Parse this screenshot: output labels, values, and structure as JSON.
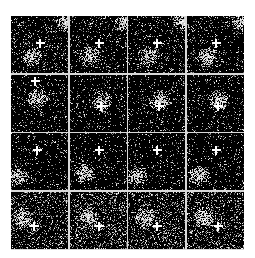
{
  "figure": {
    "layout": {
      "rows": 4,
      "cols": 4
    },
    "background": "#ffffff",
    "separator_color": "#d8d8d8",
    "panel_color": "#000000",
    "panels": [
      {
        "row": 0,
        "col": 0,
        "blob": [
          0.35,
          0.7
        ],
        "corner": [
          0.95,
          0.1
        ],
        "cross": [
          0.5,
          0.48
        ],
        "density": 0.12
      },
      {
        "row": 0,
        "col": 1,
        "blob": [
          0.35,
          0.7
        ],
        "corner": [
          0.95,
          0.1
        ],
        "cross": [
          0.5,
          0.48
        ],
        "density": 0.12
      },
      {
        "row": 0,
        "col": 2,
        "blob": [
          0.35,
          0.7
        ],
        "corner": [
          0.95,
          0.1
        ],
        "cross": [
          0.5,
          0.48
        ],
        "density": 0.12
      },
      {
        "row": 0,
        "col": 3,
        "blob": [
          0.35,
          0.72
        ],
        "corner": [
          0.95,
          0.1
        ],
        "cross": [
          0.5,
          0.48
        ],
        "density": 0.12
      },
      {
        "row": 1,
        "col": 0,
        "blob": [
          0.45,
          0.4
        ],
        "corner": null,
        "cross": [
          0.42,
          0.1
        ],
        "density": 0.1
      },
      {
        "row": 1,
        "col": 1,
        "blob": [
          0.55,
          0.45
        ],
        "corner": null,
        "cross": [
          0.55,
          0.55
        ],
        "density": 0.1
      },
      {
        "row": 1,
        "col": 2,
        "blob": [
          0.55,
          0.45
        ],
        "corner": null,
        "cross": [
          0.55,
          0.55
        ],
        "density": 0.1
      },
      {
        "row": 1,
        "col": 3,
        "blob": [
          0.55,
          0.45
        ],
        "corner": null,
        "cross": [
          0.55,
          0.55
        ],
        "density": 0.1
      },
      {
        "row": 2,
        "col": 0,
        "blob": [
          0.1,
          0.75
        ],
        "corner": null,
        "cross": [
          0.45,
          0.3
        ],
        "density": 0.09
      },
      {
        "row": 2,
        "col": 1,
        "blob": [
          0.25,
          0.7
        ],
        "corner": null,
        "cross": [
          0.5,
          0.3
        ],
        "density": 0.09
      },
      {
        "row": 2,
        "col": 2,
        "blob": [
          0.15,
          0.75
        ],
        "corner": null,
        "cross": [
          0.5,
          0.3
        ],
        "density": 0.09
      },
      {
        "row": 2,
        "col": 3,
        "blob": [
          0.2,
          0.75
        ],
        "corner": null,
        "cross": [
          0.5,
          0.3
        ],
        "density": 0.1
      },
      {
        "row": 3,
        "col": 0,
        "blob": [
          0.2,
          0.45
        ],
        "corner": null,
        "cross": [
          0.4,
          0.6
        ],
        "density": 0.2
      },
      {
        "row": 3,
        "col": 1,
        "blob": [
          0.3,
          0.45
        ],
        "corner": null,
        "cross": [
          0.5,
          0.6
        ],
        "density": 0.22
      },
      {
        "row": 3,
        "col": 2,
        "blob": [
          0.3,
          0.45
        ],
        "corner": null,
        "cross": [
          0.5,
          0.6
        ],
        "density": 0.22
      },
      {
        "row": 3,
        "col": 3,
        "blob": [
          0.3,
          0.45
        ],
        "corner": null,
        "cross": [
          0.55,
          0.6
        ],
        "density": 0.22
      }
    ]
  }
}
